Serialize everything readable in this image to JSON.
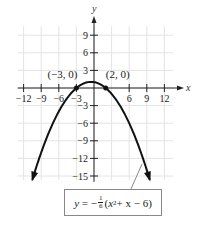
{
  "chart_data": {
    "type": "line",
    "title": "",
    "xlabel": "x",
    "ylabel": "y",
    "xlim": [
      -13,
      14
    ],
    "ylim": [
      -16,
      11
    ],
    "x_ticks": [
      -12,
      -9,
      -6,
      -3,
      6,
      9,
      12
    ],
    "y_ticks": [
      9,
      6,
      3,
      -3,
      -6,
      -9,
      -12,
      -15
    ],
    "x_tick_labels": [
      "−12",
      "−9",
      "−6",
      "−3",
      "6",
      "9",
      "12"
    ],
    "y_tick_labels": [
      "9",
      "6",
      "3",
      "−3",
      "−6",
      "−9",
      "−12",
      "−15"
    ],
    "grid": true,
    "series": [
      {
        "name": "y = -1/6(x^2 + x - 6)",
        "function": "-(x*x + x - 6)/6",
        "x_range": [
          -10.5,
          9.5
        ],
        "arrows_both_ends": true
      }
    ],
    "points": [
      {
        "x": -3,
        "y": 0,
        "label": "(−3, 0)"
      },
      {
        "x": 2,
        "y": 0,
        "label": "(2, 0)"
      }
    ],
    "annotation": {
      "text": "y = −(1/6)(x² + x − 6)",
      "prefix": "y = −",
      "frac_num": "1",
      "frac_den": "6",
      "body_open": "(",
      "var": "x",
      "exp": "2",
      "rest": " + x − 6)"
    }
  },
  "colors": {
    "curve": "#111111",
    "grid": "#e4e4e4",
    "axis": "#222222"
  }
}
